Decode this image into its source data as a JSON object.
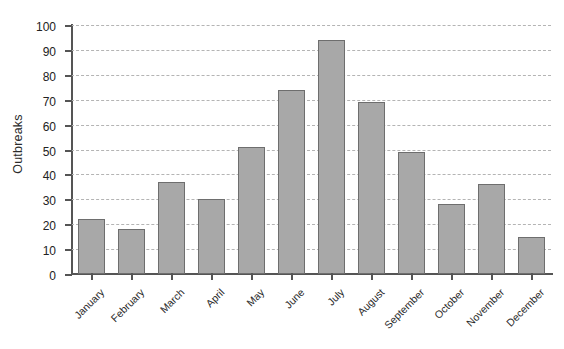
{
  "chart_data": {
    "type": "bar",
    "title": "",
    "subtitle": "",
    "xlabel": "",
    "ylabel": "Outbreaks",
    "ylim": [
      0,
      100
    ],
    "ytick_step": 10,
    "yticks": [
      0,
      10,
      20,
      30,
      40,
      50,
      60,
      70,
      80,
      90,
      100
    ],
    "grid": "horizontal-dashed",
    "legend": "none",
    "categories": [
      "January",
      "February",
      "March",
      "April",
      "May",
      "June",
      "July",
      "August",
      "September",
      "October",
      "November",
      "December"
    ],
    "values": [
      22,
      18,
      37,
      30,
      51,
      74,
      94,
      69,
      49,
      28,
      36,
      15
    ],
    "bar_fill_color": "#a8a8a8",
    "bar_edge_color": "#6e6e6e",
    "gridline_color": "#b4b4b4",
    "axis_color": "#555555"
  }
}
